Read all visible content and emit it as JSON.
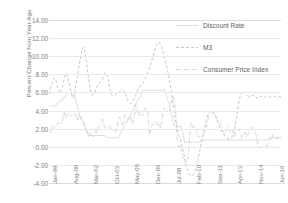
{
  "chart_data": {
    "type": "line",
    "title": "",
    "xlabel": "",
    "ylabel": "Percent Change from Year Ago",
    "ylim": [
      -4.0,
      14.0
    ],
    "ytick_labels": [
      "14.00",
      "12.00",
      "10.00",
      "8.00",
      "6.00",
      "4.00",
      "2.00",
      "0.00",
      "-2.00",
      "-4.00"
    ],
    "ytick_values": [
      14,
      12,
      10,
      8,
      6,
      4,
      2,
      0,
      -2,
      -4
    ],
    "grid": true,
    "legend_position": "right-top",
    "x_tick_labels": [
      "Jan-99",
      "Aug-00",
      "Mar-02",
      "Oct-03",
      "May-05",
      "Dec-06",
      "Jul-08",
      "Feb-10",
      "Sep-11",
      "Apr-13",
      "Nov-14",
      "Jun-16"
    ],
    "x_tick_index": [
      0,
      19,
      38,
      57,
      76,
      95,
      114,
      133,
      152,
      171,
      190,
      209
    ],
    "x_count": 215,
    "series": [
      {
        "name": "Discount Rate",
        "style": "solid",
        "color": "#d9d9d9",
        "values": [
          4.5,
          4.5,
          4.5,
          4.5,
          4.5,
          4.5,
          4.5,
          4.75,
          4.75,
          5.0,
          5.0,
          5.0,
          5.25,
          5.25,
          5.5,
          5.5,
          5.75,
          6.0,
          6.0,
          6.0,
          6.0,
          6.0,
          6.0,
          6.0,
          5.5,
          5.0,
          4.5,
          4.0,
          3.5,
          3.25,
          3.25,
          3.0,
          2.75,
          2.25,
          2.0,
          1.75,
          1.5,
          1.25,
          1.25,
          1.25,
          1.25,
          1.25,
          1.25,
          1.25,
          1.25,
          1.25,
          1.25,
          1.25,
          1.25,
          1.25,
          1.25,
          1.25,
          1.25,
          1.0,
          1.0,
          1.0,
          1.0,
          1.0,
          1.0,
          1.0,
          1.0,
          1.0,
          1.0,
          1.0,
          1.0,
          1.25,
          1.5,
          1.75,
          2.0,
          2.25,
          2.5,
          2.75,
          2.75,
          3.0,
          3.25,
          3.5,
          3.75,
          4.0,
          4.25,
          4.5,
          4.75,
          5.0,
          5.25,
          5.25,
          5.5,
          5.75,
          6.0,
          6.25,
          6.25,
          6.25,
          6.25,
          6.25,
          6.25,
          6.25,
          6.25,
          6.25,
          6.25,
          6.25,
          6.25,
          6.25,
          6.25,
          6.25,
          6.25,
          6.25,
          6.25,
          6.25,
          6.25,
          6.25,
          5.75,
          5.25,
          5.0,
          4.75,
          4.0,
          3.5,
          3.25,
          2.5,
          2.25,
          2.25,
          2.25,
          2.25,
          2.25,
          2.25,
          2.25,
          1.75,
          1.25,
          0.5,
          0.5,
          0.5,
          0.5,
          0.5,
          0.5,
          0.5,
          0.5,
          0.5,
          0.5,
          0.5,
          0.5,
          0.5,
          0.5,
          0.5,
          0.5,
          0.75,
          0.75,
          0.75,
          0.75,
          0.75,
          0.75,
          0.75,
          0.75,
          0.75,
          0.75,
          0.75,
          0.75,
          0.75,
          0.75,
          0.75,
          0.75,
          0.75,
          0.75,
          0.75,
          0.75,
          0.75,
          0.75,
          0.75,
          0.75,
          0.75,
          0.75,
          0.75,
          0.75,
          0.75,
          0.75,
          0.75,
          0.75,
          0.75,
          0.75,
          0.75,
          0.75,
          0.75,
          0.75,
          0.75,
          0.75,
          0.75,
          0.75,
          0.75,
          0.75,
          0.75,
          0.75,
          0.75,
          0.75,
          0.75,
          0.75,
          0.75,
          0.75,
          0.75,
          0.75,
          0.75,
          0.75,
          0.75,
          0.75,
          0.75,
          0.75,
          0.75,
          0.75,
          1.0,
          1.0,
          1.0,
          1.0,
          1.0,
          1.0,
          1.0,
          1.0,
          1.0,
          1.0,
          1.0,
          1.0
        ]
      },
      {
        "name": "M3",
        "style": "dashed",
        "color": "#bfbfbf",
        "values": [
          5.8,
          6.3,
          6.8,
          7.1,
          7.4,
          7.6,
          7.4,
          7.1,
          6.6,
          6.2,
          5.9,
          6.1,
          6.5,
          7.0,
          7.5,
          7.9,
          8.1,
          7.8,
          7.3,
          6.8,
          6.3,
          5.8,
          5.4,
          5.6,
          6.2,
          6.9,
          7.6,
          8.4,
          9.1,
          9.8,
          10.4,
          10.9,
          11.0,
          10.6,
          9.9,
          9.0,
          8.0,
          7.1,
          6.4,
          5.9,
          5.7,
          5.8,
          6.0,
          6.3,
          6.6,
          6.8,
          7.0,
          7.1,
          7.2,
          7.4,
          7.7,
          8.0,
          8.2,
          8.1,
          7.7,
          7.1,
          6.5,
          6.0,
          5.7,
          5.6,
          5.6,
          5.7,
          5.8,
          5.9,
          6.0,
          6.1,
          6.2,
          6.3,
          6.3,
          6.2,
          6.0,
          5.7,
          5.4,
          5.1,
          4.9,
          4.8,
          4.8,
          4.9,
          5.1,
          5.4,
          5.7,
          6.0,
          6.3,
          6.5,
          6.7,
          6.8,
          6.9,
          7.1,
          7.3,
          7.6,
          7.9,
          8.2,
          8.5,
          8.8,
          9.2,
          9.6,
          10.0,
          10.4,
          10.8,
          11.2,
          11.45,
          11.55,
          11.5,
          11.3,
          11.0,
          10.6,
          10.1,
          9.6,
          9.1,
          8.6,
          8.1,
          7.5,
          6.8,
          6.0,
          5.1,
          4.2,
          3.4,
          2.7,
          2.1,
          1.6,
          1.2,
          0.8,
          0.4,
          0.0,
          -0.5,
          -1.1,
          -1.7,
          -2.2,
          -2.6,
          -2.9,
          -3.1,
          -3.2,
          -3.2,
          -3.1,
          -2.9,
          -2.6,
          -2.2,
          -1.7,
          -1.1,
          -0.5,
          0.1,
          0.7,
          1.3,
          1.9,
          2.4,
          2.9,
          3.3,
          3.6,
          3.8,
          3.95,
          4.0,
          3.9,
          3.7,
          3.5,
          3.2,
          2.9,
          2.6,
          2.3,
          2.0,
          1.8,
          1.6,
          1.4,
          1.2,
          1.1,
          1.0,
          0.95,
          0.9,
          0.9,
          0.95,
          1.1,
          1.4,
          1.9,
          2.5,
          3.2,
          4.0,
          4.8,
          5.4,
          5.8,
          6.0,
          6.1,
          6.15,
          6.05,
          5.9,
          5.7,
          5.55,
          5.5,
          5.55,
          5.65,
          5.7,
          5.65,
          5.55,
          5.45,
          5.4,
          5.45,
          5.55,
          5.6,
          5.55,
          5.45,
          5.4,
          5.45,
          5.55,
          5.6,
          5.55,
          5.5,
          5.5,
          5.55,
          5.6,
          5.6,
          5.55,
          5.5,
          5.5,
          5.5,
          5.5,
          5.5,
          5.5
        ]
      },
      {
        "name": "Consumer Price Index",
        "style": "dashdot",
        "color": "#cfcfcf",
        "values": [
          1.7,
          1.6,
          1.7,
          2.3,
          2.1,
          2.0,
          2.1,
          2.3,
          2.6,
          2.6,
          2.6,
          2.7,
          2.7,
          3.2,
          3.8,
          3.1,
          3.2,
          3.7,
          3.7,
          3.4,
          3.5,
          3.4,
          3.4,
          3.4,
          3.7,
          3.5,
          2.9,
          3.3,
          3.6,
          3.2,
          2.7,
          2.7,
          2.6,
          2.1,
          1.9,
          1.6,
          1.1,
          1.1,
          1.5,
          1.6,
          1.2,
          1.1,
          1.5,
          1.8,
          1.5,
          2.0,
          2.2,
          2.4,
          2.6,
          3.0,
          3.0,
          2.2,
          2.1,
          2.1,
          2.1,
          2.2,
          2.3,
          2.0,
          1.8,
          1.9,
          1.9,
          1.7,
          1.7,
          2.3,
          3.1,
          3.3,
          3.0,
          2.5,
          2.5,
          3.2,
          3.5,
          3.3,
          3.0,
          3.0,
          3.1,
          3.5,
          2.8,
          2.5,
          3.2,
          3.6,
          4.7,
          4.3,
          3.5,
          3.4,
          4.0,
          3.6,
          3.4,
          3.5,
          4.2,
          4.3,
          4.1,
          3.8,
          2.1,
          1.3,
          2.0,
          2.5,
          2.4,
          2.8,
          2.8,
          2.6,
          2.4,
          2.7,
          2.4,
          2.0,
          2.8,
          3.5,
          4.3,
          4.1,
          4.0,
          4.0,
          4.0,
          3.9,
          4.2,
          5.0,
          5.6,
          5.4,
          4.9,
          3.7,
          1.1,
          0.1,
          0.0,
          0.2,
          -0.4,
          -0.7,
          -1.3,
          -1.4,
          -2.1,
          -1.5,
          -1.3,
          -0.2,
          1.8,
          2.7,
          2.6,
          2.1,
          2.3,
          2.2,
          2.0,
          1.1,
          1.2,
          1.1,
          1.1,
          1.2,
          1.1,
          1.5,
          1.6,
          2.1,
          2.7,
          3.2,
          3.6,
          3.6,
          3.6,
          3.8,
          3.9,
          3.5,
          3.4,
          3.0,
          2.9,
          2.9,
          2.7,
          2.3,
          1.7,
          1.7,
          1.4,
          1.7,
          2.0,
          2.2,
          1.8,
          1.7,
          1.6,
          2.0,
          1.5,
          1.1,
          1.4,
          1.8,
          1.8,
          2.0,
          1.5,
          1.2,
          1.0,
          1.2,
          1.5,
          1.6,
          1.1,
          1.1,
          1.6,
          2.0,
          2.1,
          2.1,
          2.0,
          1.7,
          1.7,
          1.3,
          0.8,
          -0.1,
          -0.2,
          -0.1,
          0.0,
          0.0,
          0.1,
          0.2,
          0.2,
          0.0,
          0.2,
          0.5,
          0.7,
          1.0,
          1.4,
          1.0,
          1.1,
          1.0,
          0.8,
          1.1,
          1.0,
          1.0,
          1.0
        ]
      }
    ]
  },
  "legend": {
    "items": [
      {
        "label": "Discount Rate"
      },
      {
        "label": "M3"
      },
      {
        "label": "Consumer Price Index"
      }
    ]
  },
  "colors": {
    "grid": "#e9e9e9",
    "text": "#7d7d7d",
    "background": "#ffffff"
  }
}
